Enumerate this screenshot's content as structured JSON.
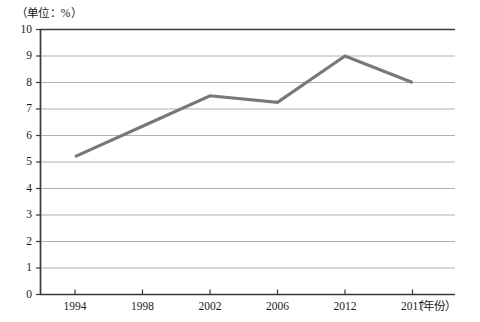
{
  "chart_data": {
    "type": "line",
    "title": "",
    "unit_caption": "（单位：%）",
    "xlabel": "（年份）",
    "ylabel": "",
    "categories": [
      "1994",
      "1998",
      "2002",
      "2006",
      "2012",
      "2017"
    ],
    "x": [
      1994,
      1998,
      2002,
      2006,
      2012,
      2017
    ],
    "series": [
      {
        "name": "",
        "values": [
          5.2,
          6.35,
          7.5,
          7.25,
          9.0,
          8.0
        ],
        "color": "#78787a"
      }
    ],
    "vertices": [
      {
        "x": "1994",
        "y": 5.2
      },
      {
        "x": "2002",
        "y": 7.5
      },
      {
        "x": "2006",
        "y": 7.25
      },
      {
        "x": "2012",
        "y": 9.0
      },
      {
        "x": "2017",
        "y": 8.0
      }
    ],
    "ylim": [
      0,
      10
    ],
    "ytick_step": 1,
    "yticks": [
      "10",
      "9",
      "8",
      "7",
      "6",
      "5",
      "4",
      "3",
      "2",
      "1",
      "0"
    ],
    "xticks": [
      "1994",
      "1998",
      "2002",
      "2006",
      "2012",
      "2017"
    ],
    "grid": true,
    "grid_axis": "y",
    "legend": false,
    "legend_position": "none",
    "line_color": "#78787a",
    "grid_color": "#a8a8a8",
    "axis_color": "#3a3a3a",
    "background": "#ffffff"
  }
}
